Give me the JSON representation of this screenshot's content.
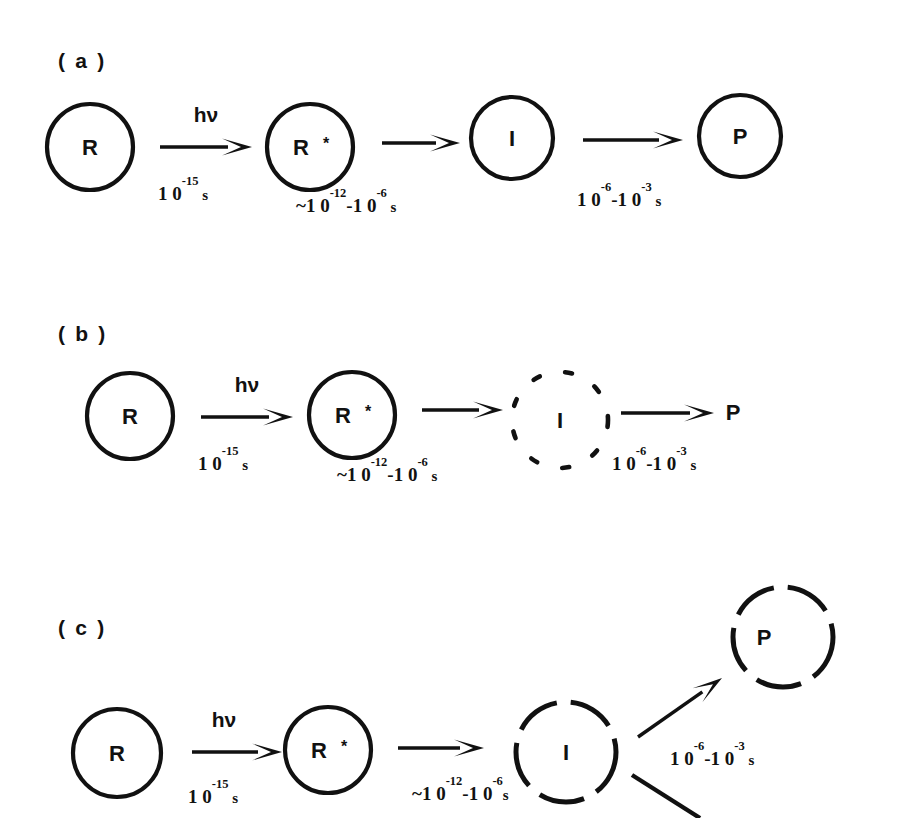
{
  "figure": {
    "background_color": "#ffffff",
    "ink_color": "#111111",
    "width": 917,
    "height": 818
  },
  "panels": [
    {
      "id": "a",
      "label": "( a )",
      "label_x": 58,
      "label_y": 68,
      "description": "All species enclosed in solid circles",
      "nodes": [
        {
          "name": "reactant",
          "text": "R",
          "star": "",
          "cx": 90,
          "cy": 147,
          "r": 43,
          "circle": "solid",
          "text_dx": 0,
          "star_dx": 0
        },
        {
          "name": "excited",
          "text": "R",
          "star": "*",
          "cx": 310,
          "cy": 147,
          "r": 43,
          "circle": "solid",
          "text_dx": -9,
          "star_dx": 16
        },
        {
          "name": "intermediate",
          "text": "I",
          "star": "",
          "cx": 512,
          "cy": 138,
          "r": 41,
          "circle": "solid",
          "text_dx": 0,
          "star_dx": 0
        },
        {
          "name": "product",
          "text": "P",
          "star": "",
          "cx": 740,
          "cy": 136,
          "r": 41,
          "circle": "solid",
          "text_dx": 0,
          "star_dx": 0
        }
      ],
      "arrows": [
        {
          "name": "excitation",
          "x1": 160,
          "y1": 147,
          "x2": 252,
          "y2": 147
        },
        {
          "name": "relaxation",
          "x1": 382,
          "y1": 143,
          "x2": 460,
          "y2": 143
        },
        {
          "name": "formation",
          "x1": 583,
          "y1": 140,
          "x2": 683,
          "y2": 140
        }
      ],
      "arrow_labels": [
        {
          "name": "photon-label",
          "text": "hν",
          "x": 206,
          "y": 122
        }
      ],
      "timescales": [
        {
          "name": "excitation-time",
          "x": 158,
          "y": 200,
          "mantissa": "1 0",
          "exponent": "-15",
          "tail": "",
          "tail_exp": "",
          "unit": " s",
          "prefix": ""
        },
        {
          "name": "relaxation-time",
          "x": 296,
          "y": 212,
          "mantissa": "1 0",
          "exponent": "-12",
          "tail": "-1 0",
          "tail_exp": "-6",
          "unit": " s",
          "prefix": "~"
        },
        {
          "name": "formation-time",
          "x": 577,
          "y": 206,
          "mantissa": "1 0",
          "exponent": "-6",
          "tail": "-1 0",
          "tail_exp": "-3",
          "unit": " s",
          "prefix": ""
        }
      ]
    },
    {
      "id": "b",
      "label": "( b )",
      "label_x": 58,
      "label_y": 341,
      "description": "Intermediate in dotted circle, product with no circle",
      "nodes": [
        {
          "name": "reactant",
          "text": "R",
          "star": "",
          "cx": 130,
          "cy": 416,
          "r": 43,
          "circle": "solid",
          "text_dx": 0,
          "star_dx": 0
        },
        {
          "name": "excited",
          "text": "R",
          "star": "*",
          "cx": 352,
          "cy": 415,
          "r": 43,
          "circle": "solid",
          "text_dx": -9,
          "star_dx": 16
        },
        {
          "name": "intermediate",
          "text": "I",
          "star": "",
          "cx": 560,
          "cy": 420,
          "r": 48,
          "circle": "dotted",
          "text_dx": 0,
          "star_dx": 0
        },
        {
          "name": "product",
          "text": "P",
          "star": "",
          "cx": 733,
          "cy": 412,
          "r": 0,
          "circle": "none",
          "text_dx": 0,
          "star_dx": 0
        }
      ],
      "arrows": [
        {
          "name": "excitation",
          "x1": 201,
          "y1": 417,
          "x2": 293,
          "y2": 417
        },
        {
          "name": "relaxation",
          "x1": 422,
          "y1": 410,
          "x2": 503,
          "y2": 410
        },
        {
          "name": "formation",
          "x1": 621,
          "y1": 413,
          "x2": 714,
          "y2": 413
        }
      ],
      "arrow_labels": [
        {
          "name": "photon-label",
          "text": "hν",
          "x": 247,
          "y": 392
        }
      ],
      "timescales": [
        {
          "name": "excitation-time",
          "x": 198,
          "y": 470,
          "mantissa": "1 0",
          "exponent": "-15",
          "tail": "",
          "tail_exp": "",
          "unit": " s",
          "prefix": ""
        },
        {
          "name": "relaxation-time",
          "x": 337,
          "y": 481,
          "mantissa": "1 0",
          "exponent": "-12",
          "tail": "-1 0",
          "tail_exp": "-6",
          "unit": " s",
          "prefix": "~"
        },
        {
          "name": "formation-time",
          "x": 612,
          "y": 470,
          "mantissa": "1 0",
          "exponent": "-6",
          "tail": "-1 0",
          "tail_exp": "-3",
          "unit": " s",
          "prefix": ""
        }
      ]
    },
    {
      "id": "c",
      "label": "( c )",
      "label_x": 58,
      "label_y": 635,
      "description": "Branching pathway; intermediate and product in dashed circles",
      "nodes": [
        {
          "name": "reactant",
          "text": "R",
          "star": "",
          "cx": 117,
          "cy": 753,
          "r": 44,
          "circle": "solid",
          "text_dx": 0,
          "star_dx": 0
        },
        {
          "name": "excited",
          "text": "R",
          "star": "*",
          "cx": 328,
          "cy": 750,
          "r": 43,
          "circle": "solid",
          "text_dx": -9,
          "star_dx": 16
        },
        {
          "name": "intermediate",
          "text": "I",
          "star": "",
          "cx": 566,
          "cy": 752,
          "r": 50,
          "circle": "dashed",
          "text_dx": 0,
          "star_dx": 0
        },
        {
          "name": "product",
          "text": "P",
          "star": "",
          "cx": 783,
          "cy": 637,
          "r": 50,
          "circle": "dashed",
          "text_dx": -19,
          "star_dx": 0
        }
      ],
      "arrows": [
        {
          "name": "excitation",
          "x1": 192,
          "y1": 752,
          "x2": 282,
          "y2": 752
        },
        {
          "name": "relaxation",
          "x1": 398,
          "y1": 748,
          "x2": 484,
          "y2": 748
        },
        {
          "name": "branch-to-product",
          "x1": 638,
          "y1": 737,
          "x2": 722,
          "y2": 678
        }
      ],
      "arrow_labels": [
        {
          "name": "photon-label",
          "text": "hν",
          "x": 224,
          "y": 727
        }
      ],
      "plain_lines": [
        {
          "name": "branch-to-second-path",
          "x1": 632,
          "y1": 775,
          "x2": 700,
          "y2": 818
        }
      ],
      "timescales": [
        {
          "name": "excitation-time",
          "x": 188,
          "y": 803,
          "mantissa": "1 0",
          "exponent": "-15",
          "tail": "",
          "tail_exp": "",
          "unit": " s",
          "prefix": ""
        },
        {
          "name": "relaxation-time",
          "x": 412,
          "y": 800,
          "mantissa": "1 0",
          "exponent": "-12",
          "tail": "-1 0",
          "tail_exp": "-6",
          "unit": "s",
          "prefix": "~"
        },
        {
          "name": "branch-time",
          "x": 670,
          "y": 765,
          "mantissa": "1 0",
          "exponent": "-6",
          "tail": "-1 0",
          "tail_exp": "-3",
          "unit": " s",
          "prefix": ""
        }
      ]
    }
  ],
  "legend_meaning": {
    "R": "reactant",
    "R*": "electronically excited reactant",
    "I": "intermediate",
    "P": "product"
  }
}
